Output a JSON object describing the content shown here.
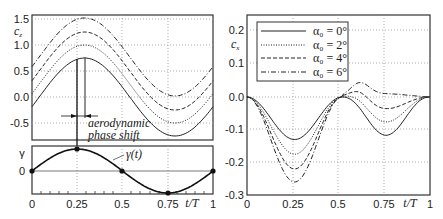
{
  "chart_data": [
    {
      "type": "line",
      "title": "",
      "xlabel": "t/T",
      "ylabel": "c_z",
      "xlim": [
        0,
        1
      ],
      "ylim": [
        -0.85,
        1.55
      ],
      "x_ticks": [
        "0",
        "0.25",
        "0.5",
        "0.75",
        "1"
      ],
      "y_ticks": [
        "1.5",
        "1.0",
        "0.5",
        "0.0",
        "-0.5"
      ],
      "grid": true,
      "series": [
        {
          "name": "alpha0 = 0°",
          "style": "solid",
          "mean": 0.0,
          "amp": 0.75,
          "phase_shift": 0.04
        },
        {
          "name": "alpha0 = 2°",
          "style": "dotted",
          "mean": 0.25,
          "amp": 0.75,
          "phase_shift": 0.04
        },
        {
          "name": "alpha0 = 4°",
          "style": "dashed",
          "mean": 0.5,
          "amp": 0.75,
          "phase_shift": 0.04
        },
        {
          "name": "alpha0 = 6°",
          "style": "dashdot",
          "mean": 0.77,
          "amp": 0.75,
          "phase_shift": 0.04
        }
      ],
      "annotations": [
        "aerodynamic",
        "phase shift"
      ]
    },
    {
      "type": "line",
      "title": "",
      "xlabel": "t/T",
      "ylabel": "γ",
      "xlim": [
        0,
        1
      ],
      "x_ticks": [
        "0",
        "0.25",
        "0.5",
        "0.75",
        "1"
      ],
      "y_ticks": [
        "γ",
        "0"
      ],
      "series": [
        {
          "name": "γ(t)",
          "style": "solid",
          "markers": [
            [
              0,
              0
            ],
            [
              0.25,
              1
            ],
            [
              0.5,
              0
            ],
            [
              0.75,
              -1
            ],
            [
              1,
              0
            ]
          ]
        }
      ],
      "annotations": [
        "γ(t)"
      ]
    },
    {
      "type": "line",
      "title": "",
      "xlabel": "t/T",
      "ylabel": "c_x",
      "xlim": [
        0,
        1
      ],
      "ylim": [
        -0.3,
        0.25
      ],
      "x_ticks": [
        "0",
        "0.25",
        "0.5",
        "0.75",
        "1"
      ],
      "y_ticks": [
        "0.2",
        "0.1",
        "0.0",
        "-0.1",
        "-0.2",
        "-0.3"
      ],
      "grid": true,
      "legend_position": "upper left",
      "series": [
        {
          "name": "α0 = 0°",
          "style": "solid",
          "min1": -0.13,
          "max_mid": 0.0,
          "min2": -0.13
        },
        {
          "name": "α0 = 2°",
          "style": "dotted",
          "min1": -0.175,
          "max_mid": 0.01,
          "min2": -0.085
        },
        {
          "name": "α0 = 4°",
          "style": "dashed",
          "min1": -0.22,
          "max_mid": 0.025,
          "min2": -0.04
        },
        {
          "name": "α0 = 6°",
          "style": "dashdot",
          "min1": -0.26,
          "max_mid": 0.04,
          "min2": 0.005
        }
      ]
    }
  ],
  "left": {
    "ylabel": "c",
    "ylabel_sub": "z",
    "yticks": [
      "1.5",
      "1.0",
      "0.5",
      "0.0",
      "-0.5"
    ],
    "annotation_line1": "aerodynamic",
    "annotation_line2": "phase shift",
    "gamma_label": "γ",
    "gamma_zero": "0",
    "gamma_curve_label": "γ(t)",
    "xticks": [
      "0",
      "0.25",
      "0.5",
      "0.75"
    ],
    "xlabel": "t/T",
    "xlast": "1"
  },
  "right": {
    "ylabel": "c",
    "ylabel_sub": "x",
    "yticks": [
      "0.2",
      "0.1",
      "0.0",
      "-0.1",
      "-0.2",
      "-0.3"
    ],
    "xticks": [
      "0",
      "0.25",
      "0.5",
      "0.75"
    ],
    "xlabel": "t/T",
    "xlast": "1",
    "legend": [
      "α₀ = 0°",
      "α₀ = 2°",
      "α₀ = 4°",
      "α₀ = 6°"
    ]
  }
}
